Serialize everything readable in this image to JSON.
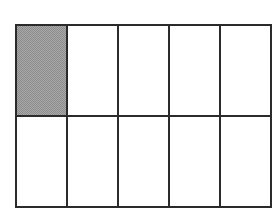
{
  "figure": {
    "shape_name": "rectangle-grid",
    "columns": 5,
    "rows": 2,
    "total_parts": 10,
    "shaded_parts": 1,
    "fraction_label": "1/10",
    "colors": {
      "background": "#ffffff",
      "line": "#2b2b2b",
      "shade_fill": "#a8a8a8",
      "shade_pattern": "#8d8d8d",
      "unshaded_fill": "#ffffff"
    },
    "cells": [
      {
        "id": "cell-r1c1",
        "row": 1,
        "column": 1,
        "shaded": true
      },
      {
        "id": "cell-r1c2",
        "row": 1,
        "column": 2,
        "shaded": false
      },
      {
        "id": "cell-r1c3",
        "row": 1,
        "column": 3,
        "shaded": false
      },
      {
        "id": "cell-r1c4",
        "row": 1,
        "column": 4,
        "shaded": false
      },
      {
        "id": "cell-r1c5",
        "row": 1,
        "column": 5,
        "shaded": false
      },
      {
        "id": "cell-r2c1",
        "row": 2,
        "column": 1,
        "shaded": false
      },
      {
        "id": "cell-r2c2",
        "row": 2,
        "column": 2,
        "shaded": false
      },
      {
        "id": "cell-r2c3",
        "row": 2,
        "column": 3,
        "shaded": false
      },
      {
        "id": "cell-r2c4",
        "row": 2,
        "column": 4,
        "shaded": false
      },
      {
        "id": "cell-r2c5",
        "row": 2,
        "column": 5,
        "shaded": false
      }
    ]
  }
}
